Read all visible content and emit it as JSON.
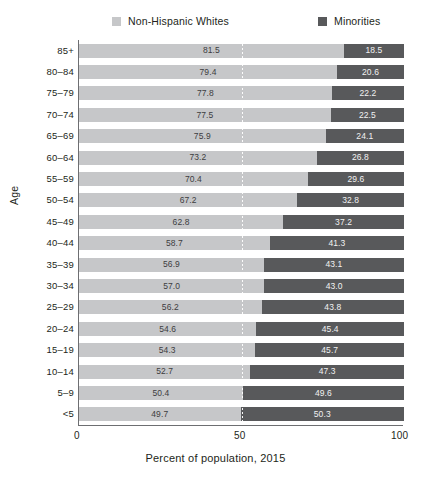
{
  "chart_data": {
    "type": "bar",
    "orientation": "horizontal",
    "stacked": true,
    "stacked_total": 100,
    "title": "",
    "xlabel": "Percent of population, 2015",
    "ylabel": "Age",
    "xlim": [
      0,
      100
    ],
    "xticks": [
      "0",
      "50",
      "100"
    ],
    "xtick_values": [
      0,
      50,
      100
    ],
    "grid": "dotted midline at 50",
    "legend_position": "top",
    "categories": [
      "85+",
      "80–84",
      "75–79",
      "70–74",
      "65–69",
      "60–64",
      "55–59",
      "50–54",
      "45–49",
      "40–44",
      "35–39",
      "30–34",
      "25–29",
      "20–24",
      "15–19",
      "10–14",
      "5–9",
      "<5"
    ],
    "series": [
      {
        "name": "Non-Hispanic Whites",
        "color": "#c6c7c9",
        "values": [
          81.5,
          79.4,
          77.8,
          77.5,
          75.9,
          73.2,
          70.4,
          67.2,
          62.8,
          58.7,
          56.9,
          57.0,
          56.2,
          54.6,
          54.3,
          52.7,
          50.4,
          49.7
        ],
        "labels": [
          "81.5",
          "79.4",
          "77.8",
          "77.5",
          "75.9",
          "73.2",
          "70.4",
          "67.2",
          "62.8",
          "58.7",
          "56.9",
          "57.0",
          "56.2",
          "54.6",
          "54.3",
          "52.7",
          "50.4",
          "49.7"
        ]
      },
      {
        "name": "Minorities",
        "color": "#58595b",
        "values": [
          18.5,
          20.6,
          22.2,
          22.5,
          24.1,
          26.8,
          29.6,
          32.8,
          37.2,
          41.3,
          43.1,
          43.0,
          43.8,
          45.4,
          45.7,
          47.3,
          49.6,
          50.3
        ],
        "labels": [
          "18.5",
          "20.6",
          "22.2",
          "22.5",
          "24.1",
          "26.8",
          "29.6",
          "32.8",
          "37.2",
          "41.3",
          "43.1",
          "43.0",
          "43.8",
          "45.4",
          "45.7",
          "47.3",
          "49.6",
          "50.3"
        ]
      }
    ]
  },
  "legend": {
    "items": [
      {
        "label": "Non-Hispanic Whites",
        "color": "#c6c7c9"
      },
      {
        "label": "Minorities",
        "color": "#58595b"
      }
    ]
  },
  "axes": {
    "y_title": "Age",
    "x_title": "Percent of population, 2015",
    "x_ticks": [
      "0",
      "50",
      "100"
    ]
  }
}
